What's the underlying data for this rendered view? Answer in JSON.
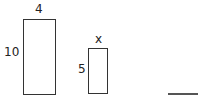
{
  "figure": {
    "large_rectangle": {
      "width_label": "4",
      "height_label": "10"
    },
    "small_rectangle": {
      "width_label": "x",
      "height_label": "5"
    },
    "answer_blank": ""
  }
}
